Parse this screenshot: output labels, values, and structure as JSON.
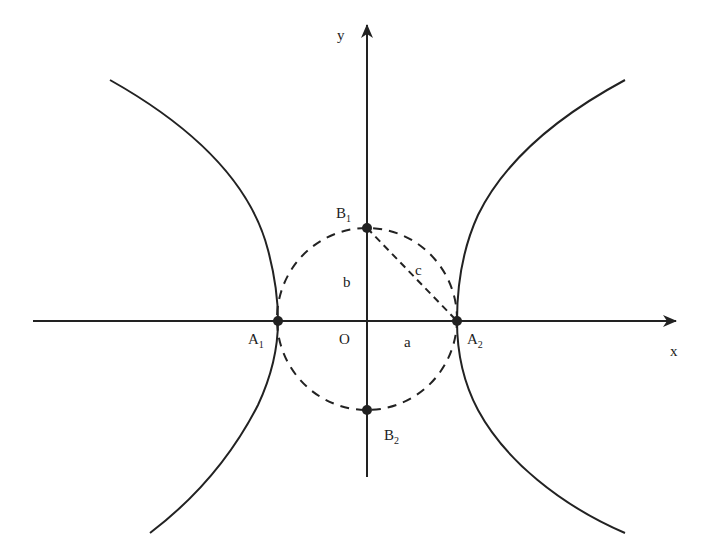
{
  "diagram": {
    "type": "hyperbola",
    "colors": {
      "stroke": "#222222",
      "background": "#ffffff"
    },
    "axes": {
      "x_label": "x",
      "y_label": "y"
    },
    "origin": {
      "label": "O"
    },
    "points": [
      {
        "id": "A1",
        "base": "A",
        "sub": "1"
      },
      {
        "id": "A2",
        "base": "A",
        "sub": "2"
      },
      {
        "id": "B1",
        "base": "B",
        "sub": "1"
      },
      {
        "id": "B2",
        "base": "B",
        "sub": "2"
      }
    ],
    "segment_labels": {
      "semi_major": "a",
      "semi_minor": "b",
      "focal": "c"
    }
  }
}
